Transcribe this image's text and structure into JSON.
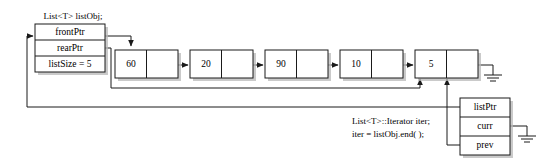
{
  "diagram": {
    "colors": {
      "ink": "#1a1a1a",
      "paper": "#ffffff",
      "shadow": "#b8b8b8"
    },
    "list_object": {
      "caption": "List<T> listObj;",
      "fields": [
        {
          "key": "frontPtr",
          "label": "frontPtr"
        },
        {
          "key": "rearPtr",
          "label": "rearPtr"
        },
        {
          "key": "listSize",
          "label": "listSize = 5"
        }
      ]
    },
    "nodes": [
      {
        "value": "60"
      },
      {
        "value": "20"
      },
      {
        "value": "90"
      },
      {
        "value": "10"
      },
      {
        "value": "5"
      }
    ],
    "iterator": {
      "caption_line1": "List<T>::Iterator iter;",
      "caption_line2": "iter = listObj.end( );",
      "fields": [
        {
          "key": "listPtr",
          "label": "listPtr"
        },
        {
          "key": "curr",
          "label": "curr"
        },
        {
          "key": "prev",
          "label": "prev"
        }
      ]
    },
    "ground_symbols": [
      {
        "name": "tail-next-null"
      },
      {
        "name": "iterator-curr-null"
      }
    ]
  }
}
